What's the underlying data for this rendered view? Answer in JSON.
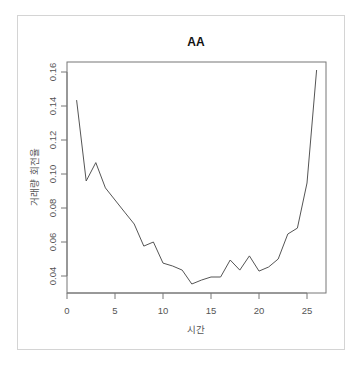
{
  "chart_data": {
    "type": "line",
    "title": "AA",
    "xlabel": "시간",
    "ylabel": "거래량 회전율",
    "xlim": [
      0,
      27
    ],
    "ylim": [
      0.032,
      0.166
    ],
    "x_ticks": [
      0,
      5,
      10,
      15,
      20,
      25
    ],
    "y_ticks": [
      0.04,
      0.06,
      0.08,
      0.1,
      0.12,
      0.14,
      0.16
    ],
    "y_tick_labels": [
      "0.04",
      "0.06",
      "0.08",
      "0.10",
      "0.12",
      "0.14",
      "0.16"
    ],
    "grid": false,
    "line_color": "#555555",
    "x": [
      1,
      2,
      3,
      4,
      5,
      6,
      7,
      8,
      9,
      10,
      11,
      12,
      13,
      14,
      15,
      16,
      17,
      18,
      19,
      20,
      21,
      22,
      23,
      24,
      25,
      26
    ],
    "values": [
      0.1435,
      0.0959,
      0.1067,
      0.0918,
      0.0847,
      0.0776,
      0.0706,
      0.0576,
      0.06,
      0.0476,
      0.0459,
      0.0435,
      0.0353,
      0.0376,
      0.0394,
      0.0394,
      0.0494,
      0.0435,
      0.0518,
      0.0429,
      0.0453,
      0.05,
      0.0647,
      0.0682,
      0.0947,
      0.1612
    ]
  }
}
